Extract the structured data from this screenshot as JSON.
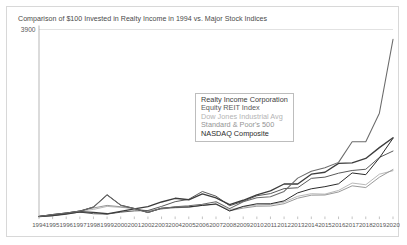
{
  "card": {
    "background": "#ffffff",
    "border_color": "#d8d8d8"
  },
  "title": "Comparison of $100 Invested in Realty Income in 1994 vs. Major Stock Indices",
  "legend": {
    "position": "center",
    "items": [
      {
        "label": "Realty Income Corporation",
        "color": "#3d3d3d"
      },
      {
        "label": "Equity REIT Index",
        "color": "#5a5a5a"
      },
      {
        "label": "Dow Jones Industrial Avg",
        "color": "#b4b4b4"
      },
      {
        "label": "Standard & Poor's 500",
        "color": "#949494"
      },
      {
        "label": "NASDAQ Composite",
        "color": "#2b2b2b"
      }
    ]
  },
  "axes": {
    "ylabel": "",
    "xlabel": "",
    "ylim": [
      100,
      3900
    ],
    "ytick_step": 200,
    "yticks": [
      "3,900",
      "3,700",
      "3,500",
      "3,300",
      "3,100",
      "2,900",
      "2,700",
      "2,500",
      "2,300",
      "2,100",
      "1,900",
      "1,700",
      "1,500",
      "1,300",
      "1,100",
      "900",
      "700",
      "500",
      "300",
      "100"
    ],
    "grid": true,
    "grid_color": "#cfcfcf"
  },
  "chart_data": {
    "type": "line",
    "title": "Comparison of $100 Invested in Realty Income in 1994 vs. Major Stock Indices",
    "xlabel": "",
    "ylabel": "",
    "ylim": [
      100,
      3900
    ],
    "grid": true,
    "legend_position": "center",
    "x": [
      1994,
      1995,
      1996,
      1997,
      1998,
      1999,
      2000,
      2001,
      2002,
      2003,
      2004,
      2005,
      2006,
      2007,
      2008,
      2009,
      2010,
      2011,
      2012,
      2013,
      2014,
      2015,
      2016,
      2017,
      2018,
      2019,
      2020
    ],
    "categories": [
      "1994",
      "1995",
      "1996",
      "1997",
      "1998",
      "1999",
      "2000",
      "2001",
      "2002",
      "2003",
      "2004",
      "2005",
      "2006",
      "2007",
      "2008",
      "2009",
      "2010",
      "2011",
      "2012",
      "2013",
      "2014",
      "2015",
      "2016",
      "2017",
      "2018",
      "2019",
      "2020"
    ],
    "series": [
      {
        "name": "Realty Income Corporation",
        "color": "#3d3d3d",
        "values": [
          100,
          118,
          150,
          196,
          185,
          155,
          205,
          255,
          300,
          395,
          470,
          440,
          560,
          480,
          340,
          430,
          540,
          620,
          760,
          760,
          960,
          1000,
          1180,
          1190,
          1280,
          1500,
          1700
        ]
      },
      {
        "name": "Equity REIT Index",
        "color": "#5a5a5a",
        "values": [
          100,
          116,
          157,
          189,
          156,
          149,
          188,
          214,
          222,
          305,
          401,
          450,
          608,
          513,
          319,
          408,
          521,
          565,
          667,
          684,
          875,
          900,
          980,
          1035,
          1060,
          1300,
          1430
        ]
      },
      {
        "name": "Dow Jones Industrial Avg",
        "color": "#b4b4b4",
        "values": [
          100,
          133,
          169,
          208,
          244,
          305,
          285,
          266,
          214,
          267,
          281,
          285,
          329,
          354,
          238,
          298,
          333,
          344,
          392,
          511,
          563,
          555,
          630,
          780,
          745,
          960,
          1030
        ]
      },
      {
        "name": "Standard & Poor's 500",
        "color": "#949494",
        "values": [
          100,
          135,
          164,
          215,
          273,
          326,
          298,
          260,
          200,
          254,
          278,
          288,
          330,
          345,
          216,
          271,
          309,
          313,
          360,
          472,
          533,
          537,
          598,
          723,
          688,
          898,
          1055
        ]
      },
      {
        "name": "NASDAQ Composite",
        "color": "#2b2b2b",
        "values": [
          100,
          140,
          172,
          209,
          292,
          540,
          330,
          262,
          180,
          268,
          290,
          296,
          325,
          355,
          212,
          305,
          358,
          358,
          417,
          580,
          663,
          706,
          764,
          985,
          950,
          1290,
          1690
        ]
      },
      {
        "name": "NASDAQ Composite Upper",
        "color": "#5f5f5f",
        "values": [
          null,
          null,
          null,
          null,
          null,
          null,
          null,
          null,
          null,
          null,
          null,
          null,
          null,
          null,
          null,
          null,
          null,
          null,
          null,
          null,
          null,
          null,
          null,
          null,
          null,
          null,
          null
        ]
      }
    ],
    "top_series": {
      "name": "NASDAQ Composite",
      "note": "upper trace reaching peak near 3,700 in 2019 then 3,300 in 2020",
      "values": [
        100,
        140,
        172,
        209,
        292,
        540,
        330,
        262,
        180,
        268,
        290,
        296,
        325,
        355,
        212,
        305,
        358,
        358,
        417,
        580,
        663,
        706,
        764,
        985,
        950,
        1290,
        1690
      ],
      "upper_path": [
        {
          "year": 2003,
          "value": 260
        },
        {
          "year": 2004,
          "value": 300
        },
        {
          "year": 2005,
          "value": 320
        },
        {
          "year": 2006,
          "value": 350
        },
        {
          "year": 2007,
          "value": 400
        },
        {
          "year": 2008,
          "value": 260
        },
        {
          "year": 2009,
          "value": 400
        },
        {
          "year": 2010,
          "value": 480
        },
        {
          "year": 2011,
          "value": 500
        },
        {
          "year": 2012,
          "value": 610
        },
        {
          "year": 2013,
          "value": 880
        },
        {
          "year": 2014,
          "value": 1020
        },
        {
          "year": 2015,
          "value": 1090
        },
        {
          "year": 2016,
          "value": 1200
        },
        {
          "year": 2017,
          "value": 1620
        },
        {
          "year": 2018,
          "value": 1620
        },
        {
          "year": 2019,
          "value": 2200
        },
        {
          "year": 2020,
          "value": 3700
        }
      ]
    }
  }
}
